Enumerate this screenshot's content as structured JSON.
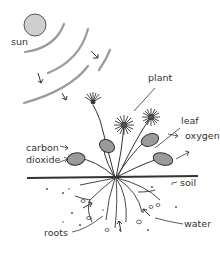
{
  "diagram": {
    "labels": {
      "sun": "sun",
      "plant": "plant",
      "leaf": "leaf",
      "oxygen": "oxygen",
      "carbon_dioxide_line1": "carbon",
      "carbon_dioxide_line2": "dioxide",
      "soil": "soil",
      "water": "water",
      "roots": "roots"
    },
    "colors": {
      "line": "#333333",
      "sun_fill": "#cfcfcf",
      "leaf_fill": "#9a9a9a",
      "ray": "#bdbdbd"
    }
  }
}
